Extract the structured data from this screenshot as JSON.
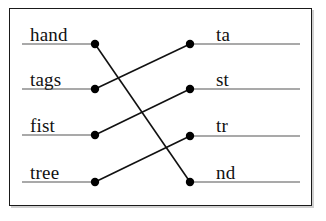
{
  "diagram": {
    "background_color": "#ffffff",
    "border_color": "#1a1a1a",
    "line_color": "#8c8c8c",
    "connector_color": "#111111",
    "dot_color": "#000000",
    "text_color": "#111111",
    "left_column": [
      {
        "id": "hand",
        "label": "hand",
        "row": 0,
        "dot_x": 95,
        "dot_y": 44,
        "line_x1": 22,
        "line_x2": 95
      },
      {
        "id": "tags",
        "label": "tags",
        "row": 1,
        "dot_x": 95,
        "dot_y": 89,
        "line_x1": 22,
        "line_x2": 95
      },
      {
        "id": "fist",
        "label": "fist",
        "row": 2,
        "dot_x": 95,
        "dot_y": 135,
        "line_x1": 22,
        "line_x2": 95
      },
      {
        "id": "tree",
        "label": "tree",
        "row": 3,
        "dot_x": 95,
        "dot_y": 182,
        "line_x1": 22,
        "line_x2": 95
      }
    ],
    "right_column": [
      {
        "id": "ta",
        "label": "ta",
        "row": 0,
        "dot_x": 190,
        "dot_y": 44,
        "line_x1": 190,
        "line_x2": 300
      },
      {
        "id": "st",
        "label": "st",
        "row": 1,
        "dot_x": 190,
        "dot_y": 89,
        "line_x1": 190,
        "line_x2": 300
      },
      {
        "id": "tr",
        "label": "tr",
        "row": 2,
        "dot_x": 190,
        "dot_y": 136,
        "line_x1": 190,
        "line_x2": 300
      },
      {
        "id": "nd",
        "label": "nd",
        "row": 3,
        "dot_x": 190,
        "dot_y": 182,
        "line_x1": 190,
        "line_x2": 300
      }
    ],
    "connections": [
      {
        "from": "hand",
        "to": "nd",
        "x1": 95,
        "y1": 44,
        "x2": 190,
        "y2": 182
      },
      {
        "from": "tags",
        "to": "ta",
        "x1": 95,
        "y1": 89,
        "x2": 190,
        "y2": 44
      },
      {
        "from": "fist",
        "to": "st",
        "x1": 95,
        "y1": 135,
        "x2": 190,
        "y2": 89
      },
      {
        "from": "tree",
        "to": "tr",
        "x1": 95,
        "y1": 182,
        "x2": 190,
        "y2": 136
      }
    ],
    "dot_radius": 4.2,
    "underline_width": 1.3,
    "connector_width": 1.6
  }
}
